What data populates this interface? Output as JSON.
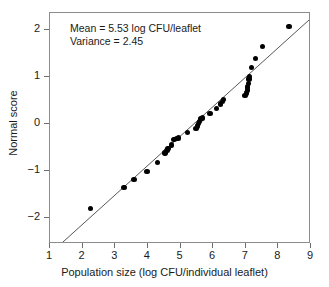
{
  "chart_data": {
    "type": "scatter",
    "title": "",
    "xlabel": "Population size (log CFU/individual leaflet)",
    "ylabel": "Normal score",
    "xlim": [
      1,
      9
    ],
    "ylim": [
      -2.55,
      2.35
    ],
    "xticks": [
      1,
      2,
      3,
      4,
      5,
      6,
      7,
      8,
      9
    ],
    "xticklabels": [
      "1",
      "2",
      "3",
      "4",
      "5",
      "6",
      "7",
      "8",
      "9"
    ],
    "yticks": [
      -2,
      -1,
      0,
      1,
      2
    ],
    "yticklabels": [
      "−2",
      "−1",
      "0",
      "1",
      "2"
    ],
    "grid": false,
    "legend": null,
    "annotations": [
      "Mean = 5.53 log CFU/leaflet",
      "Variance = 2.45"
    ],
    "statistics": {
      "mean": 5.53,
      "mean_units": "log CFU/leaflet",
      "variance": 2.45
    },
    "reference_line": {
      "label": "normal fit line",
      "x_start": 1.4,
      "y_start": -2.55,
      "x_end": 9.0,
      "y_end": 2.2
    },
    "series": [
      {
        "name": "leaflet samples",
        "marker": "filled-circle",
        "color": "#000000",
        "points": [
          [
            2.25,
            -1.8
          ],
          [
            3.27,
            -1.35
          ],
          [
            3.58,
            -1.18
          ],
          [
            3.97,
            -1.01
          ],
          [
            4.3,
            -0.82
          ],
          [
            4.52,
            -0.62
          ],
          [
            4.58,
            -0.57
          ],
          [
            4.62,
            -0.52
          ],
          [
            4.72,
            -0.45
          ],
          [
            4.8,
            -0.33
          ],
          [
            4.88,
            -0.31
          ],
          [
            4.93,
            -0.3
          ],
          [
            5.22,
            -0.19
          ],
          [
            5.48,
            -0.1
          ],
          [
            5.52,
            -0.05
          ],
          [
            5.55,
            0.0
          ],
          [
            5.58,
            0.05
          ],
          [
            5.62,
            0.1
          ],
          [
            5.68,
            0.12
          ],
          [
            5.9,
            0.22
          ],
          [
            6.1,
            0.33
          ],
          [
            6.22,
            0.42
          ],
          [
            6.28,
            0.47
          ],
          [
            6.32,
            0.52
          ],
          [
            6.98,
            0.6
          ],
          [
            7.02,
            0.65
          ],
          [
            7.05,
            0.72
          ],
          [
            7.06,
            0.78
          ],
          [
            7.08,
            0.86
          ],
          [
            7.1,
            0.95
          ],
          [
            7.12,
            1.0
          ],
          [
            7.18,
            1.19
          ],
          [
            7.3,
            1.38
          ],
          [
            7.52,
            1.64
          ],
          [
            8.32,
            2.07
          ]
        ]
      }
    ]
  },
  "axes": {
    "x_title": "Population size (log CFU/individual leaflet)",
    "y_title": "Normal score"
  }
}
